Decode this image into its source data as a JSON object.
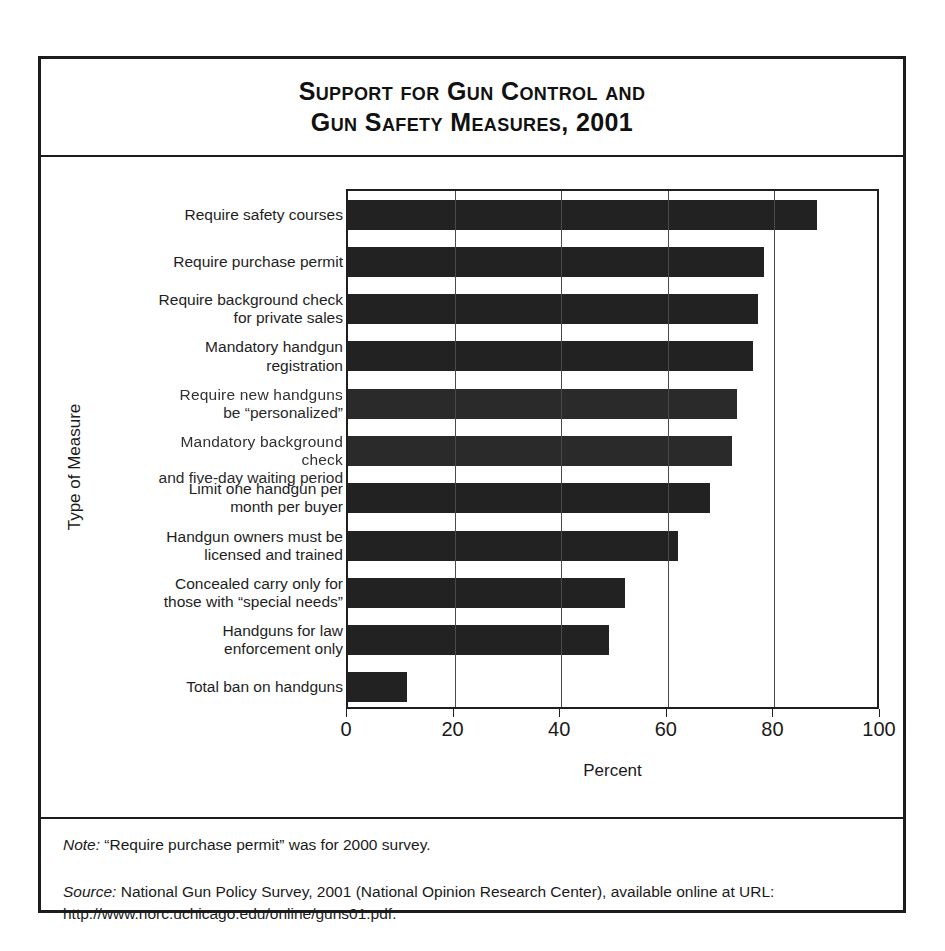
{
  "figure": {
    "title_line_1": "Support for Gun Control and",
    "title_line_2": "Gun Safety Measures,  2001",
    "note_label": "Note:",
    "note_text": " “Require purchase permit” was for 2000 survey.",
    "source_label": "Source:",
    "source_text": " National Gun Policy Survey, 2001 (National Opinion Research Center), available online at URL: http://www.norc.uchicago.edu/online/guns01.pdf."
  },
  "chart_data": {
    "type": "bar",
    "orientation": "horizontal",
    "title": "Support for Gun Control and Gun Safety Measures, 2001",
    "xlabel": "Percent",
    "ylabel": "Type of Measure",
    "xlim": [
      0,
      100
    ],
    "xticks": [
      0,
      20,
      40,
      60,
      80,
      100
    ],
    "xtick_labels": [
      "0",
      "20",
      "40",
      "60",
      "80",
      "100"
    ],
    "grid": "vertical",
    "legend": "none",
    "bar_color": "#222222",
    "categories": [
      "Require safety courses",
      "Require purchase permit",
      "Require background check\nfor private sales",
      "Mandatory handgun\nregistration",
      "Require new handguns\nbe “personalized”",
      "Mandatory background check\nand five-day waiting period",
      "Limit one handgun per\nmonth per buyer",
      "Handgun owners must be\nlicensed and trained",
      "Concealed carry only for\nthose with “special needs”",
      "Handguns for law\nenforcement only",
      "Total ban on handguns"
    ],
    "values": [
      88,
      78,
      77,
      76,
      73,
      72,
      68,
      62,
      52,
      49,
      11
    ]
  },
  "axis": {
    "x_title": "Percent",
    "y_title": "Type of Measure"
  }
}
